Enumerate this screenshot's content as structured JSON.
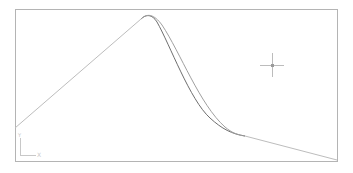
{
  "viewport": {
    "background": "#ffffff",
    "frame": {
      "x": 15,
      "y": 9,
      "width": 322,
      "height": 152,
      "color": "#b4b4b4"
    }
  },
  "drawing": {
    "polyline_color": "#bdbdbd",
    "curve_dark_color": "#6e6e6e",
    "curve_light_color": "#a0a0a0",
    "polyline": {
      "points": [
        [
          15,
          128
        ],
        [
          141,
          19
        ]
      ]
    },
    "tail": {
      "points": [
        [
          245,
          136
        ],
        [
          337,
          160
        ]
      ]
    },
    "spline_a": {
      "path": "M141,19 C146,14 152,14 157,22 C170,45 190,100 210,118 C222,129 232,134 245,136"
    },
    "spline_b": {
      "path": "M141,19 C147,13 154,14 162,25 C180,52 200,105 225,127 C232,133 238,135 245,136"
    }
  },
  "crosshair": {
    "cx": 272,
    "cy": 65,
    "arm": 12,
    "color": "#bcbcbc",
    "center_color": "#9a9a9a"
  },
  "ucs_icon": {
    "x_label": "X",
    "y_label": "Y",
    "color": "#c8c8c8"
  }
}
